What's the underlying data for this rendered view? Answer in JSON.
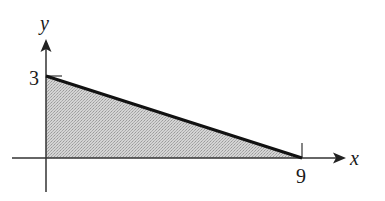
{
  "diagram": {
    "type": "shaded-triangle-region",
    "axes": {
      "x_label": "x",
      "y_label": "y"
    },
    "tick_labels": {
      "y_intercept": "3",
      "x_intercept": "9"
    },
    "line": {
      "from": [
        0,
        3
      ],
      "to": [
        9,
        0
      ]
    },
    "region": {
      "vertices": [
        [
          0,
          0
        ],
        [
          0,
          3
        ],
        [
          9,
          0
        ]
      ],
      "fill": "#c8c8c8"
    },
    "colors": {
      "axis": "#333333",
      "line": "#111111",
      "fill": "#c8c8c8",
      "background": "#ffffff"
    }
  }
}
